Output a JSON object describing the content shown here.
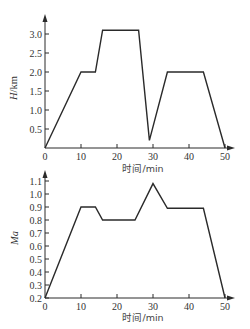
{
  "chart_data": [
    {
      "type": "line",
      "title": "",
      "xlabel": "时间/min",
      "ylabel": "H/km",
      "xlim": [
        0,
        50
      ],
      "ylim": [
        0,
        3.2
      ],
      "x_ticks": [
        "0",
        "10",
        "20",
        "30",
        "40",
        "50"
      ],
      "y_ticks": [
        "0.5",
        "1.0",
        "1.5",
        "2.0",
        "2.5",
        "3.0"
      ],
      "grid": false,
      "series": [
        {
          "name": "H",
          "x": [
            0,
            10,
            14,
            16,
            26,
            29,
            34,
            44,
            50
          ],
          "values": [
            0,
            2.0,
            2.0,
            3.1,
            3.1,
            0.2,
            2.0,
            2.0,
            0
          ]
        }
      ]
    },
    {
      "type": "line",
      "title": "",
      "xlabel": "时间/min",
      "ylabel": "Ma",
      "xlim": [
        0,
        50
      ],
      "ylim": [
        0.2,
        1.15
      ],
      "x_ticks": [
        "0",
        "10",
        "20",
        "30",
        "40",
        "50"
      ],
      "y_ticks": [
        "0.2",
        "0.3",
        "0.4",
        "0.5",
        "0.6",
        "0.7",
        "0.8",
        "0.9",
        "1.0",
        "1.1"
      ],
      "grid": false,
      "series": [
        {
          "name": "Ma",
          "x": [
            0,
            10,
            14,
            16,
            25,
            30,
            34,
            44,
            50
          ],
          "values": [
            0.2,
            0.9,
            0.9,
            0.8,
            0.8,
            1.08,
            0.89,
            0.89,
            0.2
          ]
        }
      ]
    }
  ],
  "labels": {
    "top_ylabel_main": "H",
    "top_ylabel_unit": "/km",
    "bottom_ylabel": "Ma",
    "xlabel": "时间/min"
  }
}
